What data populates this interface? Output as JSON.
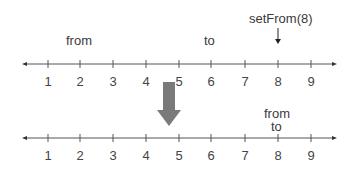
{
  "top_line": {
    "ticks": [
      "1",
      "2",
      "3",
      "4",
      "5",
      "6",
      "7",
      "8",
      "9"
    ],
    "from_label": "from",
    "to_label": "to",
    "call_label": "setFrom(8)"
  },
  "bottom_line": {
    "ticks": [
      "1",
      "2",
      "3",
      "4",
      "5",
      "6",
      "7",
      "8",
      "9"
    ],
    "from_label": "from",
    "to_label": "to"
  },
  "colors": {
    "line": "#555555",
    "transition_arrow": "#7a7a7a"
  }
}
